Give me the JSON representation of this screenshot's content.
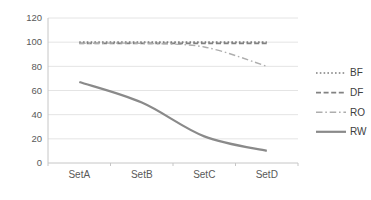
{
  "chart_data": {
    "type": "line",
    "title": "",
    "xlabel": "",
    "ylabel": "",
    "categories": [
      "SetA",
      "SetB",
      "SetC",
      "SetD"
    ],
    "series": [
      {
        "name": "BF",
        "values": [
          100,
          100,
          100,
          100
        ],
        "style": "dotted",
        "color": "#7f7f7f",
        "width": 1.7
      },
      {
        "name": "DF",
        "values": [
          99,
          99,
          99,
          99
        ],
        "style": "dashed",
        "color": "#828282",
        "width": 1.7
      },
      {
        "name": "RO",
        "values": [
          99,
          99,
          96,
          80
        ],
        "style": "dashdot",
        "color": "#aeaeae",
        "width": 1.4
      },
      {
        "name": "RW",
        "values": [
          67,
          50,
          22,
          10
        ],
        "style": "solid",
        "color": "#8a8a8a",
        "width": 2.2
      }
    ],
    "ylim": [
      0,
      120
    ],
    "yticks": [
      0,
      20,
      40,
      60,
      80,
      100,
      120
    ],
    "grid": true,
    "legend_position": "right",
    "smooth_lines": true
  },
  "style_colors": {
    "grid_color": "#e4e4e4",
    "axis_color": "#c6c6c6",
    "tick_label_color": "#595959",
    "legend_text_color": "#404040"
  }
}
